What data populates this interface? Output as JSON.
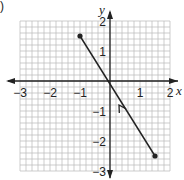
{
  "problem_marker": ")",
  "chart_data": {
    "type": "line",
    "title": "",
    "xlabel": "x",
    "ylabel": "y",
    "xlim": [
      -3,
      2
    ],
    "ylim": [
      -3,
      2
    ],
    "x_ticks": [
      -3,
      -2,
      -1,
      1,
      2
    ],
    "y_ticks": [
      2,
      1,
      -1,
      -2,
      -3
    ],
    "x_tick_labels": [
      "−3",
      "−2",
      "−1",
      "1",
      "2"
    ],
    "y_tick_labels": [
      "2",
      "1",
      "−1",
      "−2",
      "−3"
    ],
    "grid": true,
    "grid_minor_step": 0.2,
    "series": [
      {
        "name": "segment",
        "points": [
          [
            -1,
            1.5
          ],
          [
            1.5,
            -2.5
          ]
        ],
        "endpoints_closed": true,
        "direction_arrow": {
          "at": [
            0.3,
            -0.8
          ],
          "pointing": "toward (-1, 1.5)"
        }
      }
    ],
    "colors": {
      "grid": "#b8b8b8",
      "axis": "#222222",
      "line": "#222222"
    }
  }
}
